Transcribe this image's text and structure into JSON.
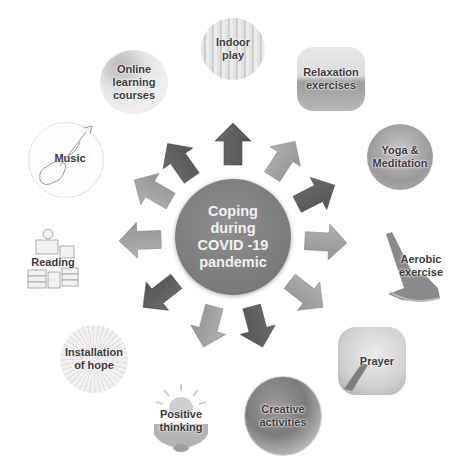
{
  "center": {
    "lines": [
      "Coping",
      "during",
      "COVID -19",
      "pandemic"
    ],
    "color": "#7e7e7e"
  },
  "nodes": [
    {
      "id": "indoor-play",
      "lines": [
        "Indoor",
        "play"
      ]
    },
    {
      "id": "relaxation-exercises",
      "lines": [
        "Relaxation",
        "exercises"
      ]
    },
    {
      "id": "yoga-meditation",
      "lines": [
        "Yoga &",
        "Meditation"
      ]
    },
    {
      "id": "aerobic-exercise",
      "lines": [
        "Aerobic",
        "exercise"
      ]
    },
    {
      "id": "prayer",
      "lines": [
        "Prayer"
      ]
    },
    {
      "id": "creative-activities",
      "lines": [
        "Creative",
        "activities"
      ]
    },
    {
      "id": "positive-thinking",
      "lines": [
        "Positive",
        "thinking"
      ]
    },
    {
      "id": "installation-of-hope",
      "lines": [
        "Installation",
        "of hope"
      ]
    },
    {
      "id": "reading",
      "lines": [
        "Reading"
      ]
    },
    {
      "id": "music",
      "lines": [
        "Music"
      ]
    },
    {
      "id": "online-learning-courses",
      "lines": [
        "Online",
        "learning",
        "courses"
      ]
    }
  ],
  "arrow_colors": {
    "dark": "#5f5f5f",
    "light": "#a3a3a3"
  }
}
